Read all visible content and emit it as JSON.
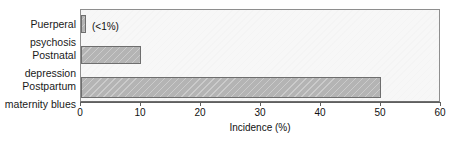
{
  "chart_data": {
    "type": "bar",
    "orientation": "horizontal",
    "title": "",
    "subtitle": "",
    "xlabel": "Incidence (%)",
    "ylabel": "",
    "xlim": [
      0,
      60
    ],
    "xticks": [
      0,
      10,
      20,
      30,
      40,
      50,
      60
    ],
    "xticklabels": [
      "0",
      "10",
      "20",
      "30",
      "40",
      "50",
      "60"
    ],
    "grid": false,
    "legend": null,
    "categories": [
      "Puerperal\npsychosis",
      "Postnatal\ndepression",
      "Postpartum\nmaternity blues"
    ],
    "values": [
      0.8,
      10,
      50
    ],
    "annotations": [
      {
        "category": "Puerperal psychosis",
        "text": "(<1%)"
      }
    ],
    "colors": {
      "bar_fill": "#b4b4b4",
      "bar_edge": "#6e6e6e",
      "plot_background": "#f7f7f7",
      "frame": "#8e8e8e",
      "axis": "#5f5f5f",
      "text": "#111111"
    }
  }
}
